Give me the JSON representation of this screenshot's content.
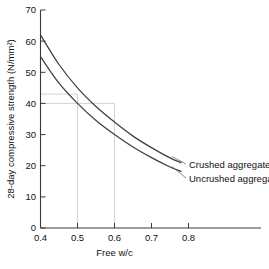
{
  "chart_data": {
    "type": "line",
    "title": "",
    "xlabel": "Free w/c",
    "ylabel": "28-day compressive strength (N/mm²)",
    "xlim": [
      0.4,
      0.8
    ],
    "ylim": [
      0,
      70
    ],
    "xticks": [
      "0.4",
      "0.5",
      "0.6",
      "0.7",
      "0.8"
    ],
    "xtick_values": [
      0.4,
      0.5,
      0.6,
      0.7,
      0.8
    ],
    "yticks": [
      "0",
      "10",
      "20",
      "30",
      "40",
      "50",
      "60",
      "70"
    ],
    "ytick_values": [
      0,
      10,
      20,
      30,
      40,
      50,
      60,
      70
    ],
    "grid": false,
    "legend_position": "inline-right-annotation",
    "series": [
      {
        "name": "Crushed aggregates",
        "x": [
          0.4,
          0.45,
          0.5,
          0.55,
          0.6,
          0.65,
          0.7,
          0.75,
          0.78
        ],
        "values": [
          62.0,
          52.5,
          45.0,
          39.0,
          34.0,
          29.5,
          25.8,
          22.5,
          21.0
        ]
      },
      {
        "name": "Uncrushed aggregates",
        "x": [
          0.4,
          0.45,
          0.5,
          0.55,
          0.6,
          0.65,
          0.7,
          0.75,
          0.78
        ],
        "values": [
          55.0,
          46.5,
          40.0,
          34.5,
          30.0,
          26.0,
          22.6,
          19.6,
          18.2
        ]
      }
    ],
    "annotations": [
      {
        "name": "construction-line-wc-0.5",
        "type": "vertical",
        "x": 0.5,
        "y_from": 0,
        "y_to": 43
      },
      {
        "name": "construction-line-wc-0.6",
        "type": "vertical",
        "x": 0.6,
        "y_from": 0,
        "y_to": 40
      },
      {
        "name": "construction-line-strength-43",
        "type": "horizontal",
        "y": 43,
        "x_from": 0.4,
        "x_to": 0.5
      },
      {
        "name": "construction-line-strength-40",
        "type": "horizontal",
        "y": 40,
        "x_from": 0.4,
        "x_to": 0.6
      }
    ]
  },
  "labels": {
    "series_crushed": "Crushed aggregates",
    "series_uncrushed": "Uncrushed aggregates",
    "x_axis_title": "Free w/c",
    "y_axis_title": "28-day compressive strength (N/mm²)",
    "xtick_0": "0.4",
    "xtick_1": "0.5",
    "xtick_2": "0.6",
    "xtick_3": "0.7",
    "xtick_4": "0.8",
    "ytick_0": "0",
    "ytick_1": "10",
    "ytick_2": "20",
    "ytick_3": "30",
    "ytick_4": "40",
    "ytick_5": "50",
    "ytick_6": "60",
    "ytick_7": "70"
  },
  "colors": {
    "background": "#ffffff",
    "axis": "#3a3a3a",
    "curve": "#3f3f3f",
    "guide": "#c8c8c8",
    "text": "#111111"
  }
}
